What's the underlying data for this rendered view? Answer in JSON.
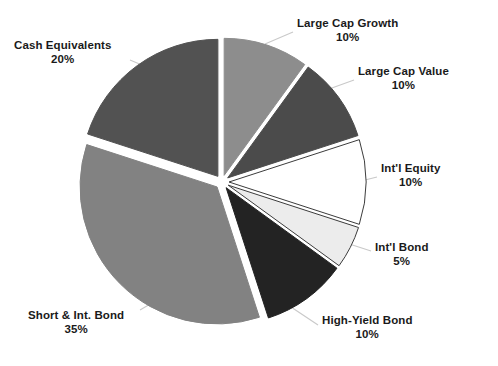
{
  "chart_data": {
    "type": "pie",
    "title": "",
    "subtitle": "",
    "xlabel": "",
    "ylabel": "",
    "legend_position": "labels-outside",
    "grid": false,
    "total": 100,
    "units": "%",
    "categories": [
      "Large Cap Growth",
      "Large Cap Value",
      "Int'l Equity",
      "Int'l Bond",
      "High-Yield Bond",
      "Short & Int. Bond",
      "Cash Equivalents"
    ],
    "values": [
      10,
      10,
      10,
      5,
      10,
      35,
      20
    ],
    "slices": [
      {
        "name": "Large Cap Growth",
        "value": 10,
        "label": "Large Cap Growth",
        "pct": "10%",
        "color": "#8d8d8d",
        "stroke": "#8d8d8d",
        "start_deg": 0,
        "end_deg": 36
      },
      {
        "name": "Large Cap Value",
        "value": 10,
        "label": "Large Cap Value",
        "pct": "10%",
        "color": "#4b4b4b",
        "stroke": "#4b4b4b",
        "start_deg": 36,
        "end_deg": 72
      },
      {
        "name": "Int'l Equity",
        "value": 10,
        "label": "Int'l Equity",
        "pct": "10%",
        "color": "#ffffff",
        "stroke": "#3c3c3c",
        "start_deg": 72,
        "end_deg": 108
      },
      {
        "name": "Int'l Bond",
        "value": 5,
        "label": "Int'l Bond",
        "pct": "5%",
        "color": "#ececec",
        "stroke": "#3c3c3c",
        "start_deg": 108,
        "end_deg": 126
      },
      {
        "name": "High-Yield Bond",
        "value": 10,
        "label": "High-Yield Bond",
        "pct": "10%",
        "color": "#232323",
        "stroke": "#232323",
        "start_deg": 126,
        "end_deg": 162
      },
      {
        "name": "Short & Int. Bond",
        "value": 35,
        "label": "Short & Int. Bond",
        "pct": "35%",
        "color": "#828282",
        "stroke": "#828282",
        "start_deg": 162,
        "end_deg": 288
      },
      {
        "name": "Cash Equivalents",
        "value": 20,
        "label": "Cash Equivalents",
        "pct": "20%",
        "color": "#525252",
        "stroke": "#525252",
        "start_deg": 288,
        "end_deg": 360
      }
    ],
    "background": "#ffffff",
    "leader_line_color": "#c9c9c9",
    "text_color": "#1a1a1a"
  },
  "labels": {
    "large_cap_growth": {
      "name": "Large Cap Growth",
      "pct": "10%"
    },
    "large_cap_value": {
      "name": "Large Cap Value",
      "pct": "10%"
    },
    "intl_equity": {
      "name": "Int'l Equity",
      "pct": "10%"
    },
    "intl_bond": {
      "name": "Int'l Bond",
      "pct": "5%"
    },
    "high_yield_bond": {
      "name": "High-Yield Bond",
      "pct": "10%"
    },
    "short_int_bond": {
      "name": "Short & Int. Bond",
      "pct": "35%"
    },
    "cash_equivalents": {
      "name": "Cash Equivalents",
      "pct": "20%"
    }
  }
}
